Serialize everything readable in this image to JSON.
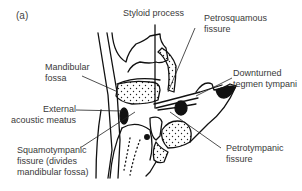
{
  "figure": {
    "panel_label": "(a)",
    "labels": {
      "styloid_process": "Styloid process",
      "petrosquamous_fissure_l1": "Petrosquamous",
      "petrosquamous_fissure_l2": "fissure",
      "mandibular_fossa_l1": "Mandibular",
      "mandibular_fossa_l2": "fossa",
      "downturned_tegmen_l1": "Downturned",
      "downturned_tegmen_l2": "tegmen tympani",
      "external_acoustic_l1": "External",
      "external_acoustic_l2": "acoustic meatus",
      "squamotympanic_l1": "Squamotympanic",
      "squamotympanic_l2": "fissure (divides",
      "squamotympanic_l3": "mandibular fossa)",
      "petrotympanic_l1": "Petrotympanic",
      "petrotympanic_l2": "fissure"
    }
  }
}
